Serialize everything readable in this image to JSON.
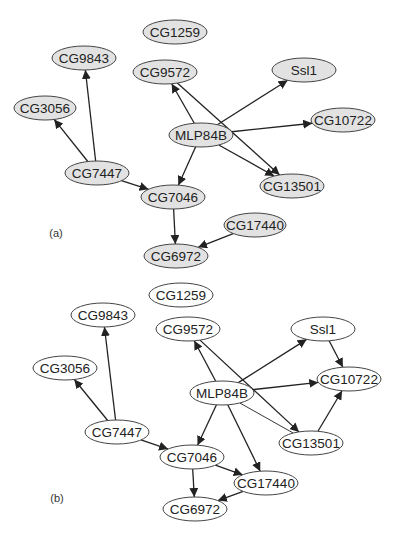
{
  "colors": {
    "node_fill_a": "#e2e2e2",
    "node_fill_b": "#ffffff",
    "stroke": "#444444",
    "edge": "#222222"
  },
  "panels": [
    {
      "label": "(a)",
      "label_pos": [
        56,
        233
      ],
      "node_style": "node-a",
      "nodes": [
        {
          "id": "CG1259",
          "label": "CG1259",
          "x": 175,
          "y": 32,
          "rx": 32,
          "ry": 12
        },
        {
          "id": "CG9843",
          "label": "CG9843",
          "x": 84,
          "y": 58,
          "rx": 32,
          "ry": 12
        },
        {
          "id": "CG9572",
          "label": "CG9572",
          "x": 165,
          "y": 72,
          "rx": 32,
          "ry": 12
        },
        {
          "id": "Ssl1",
          "label": "Ssl1",
          "x": 304,
          "y": 70,
          "rx": 32,
          "ry": 12
        },
        {
          "id": "CG3056",
          "label": "CG3056",
          "x": 45,
          "y": 108,
          "rx": 31,
          "ry": 12
        },
        {
          "id": "MLP84B",
          "label": "MLP84B",
          "x": 201,
          "y": 135,
          "rx": 32,
          "ry": 12
        },
        {
          "id": "CG10722",
          "label": "CG10722",
          "x": 343,
          "y": 120,
          "rx": 32,
          "ry": 12
        },
        {
          "id": "CG7447",
          "label": "CG7447",
          "x": 97,
          "y": 173,
          "rx": 32,
          "ry": 12
        },
        {
          "id": "CG13501",
          "label": "CG13501",
          "x": 292,
          "y": 186,
          "rx": 32,
          "ry": 12
        },
        {
          "id": "CG7046",
          "label": "CG7046",
          "x": 173,
          "y": 197,
          "rx": 32,
          "ry": 12
        },
        {
          "id": "CG17440",
          "label": "CG17440",
          "x": 255,
          "y": 225,
          "rx": 31,
          "ry": 12
        },
        {
          "id": "CG6972",
          "label": "CG6972",
          "x": 176,
          "y": 256,
          "rx": 32,
          "ry": 12
        }
      ],
      "edges": [
        {
          "from": "CG7447",
          "to": "CG3056"
        },
        {
          "from": "CG7447",
          "to": "CG9843"
        },
        {
          "from": "CG7447",
          "to": "CG7046"
        },
        {
          "from": "MLP84B",
          "to": "CG9572"
        },
        {
          "from": "MLP84B",
          "to": "Ssl1"
        },
        {
          "from": "MLP84B",
          "to": "CG10722"
        },
        {
          "from": "MLP84B",
          "to": "CG13501"
        },
        {
          "from": "MLP84B",
          "to": "CG7046"
        },
        {
          "from": "CG9572",
          "to": "CG13501"
        },
        {
          "from": "CG7046",
          "to": "CG6972"
        },
        {
          "from": "CG17440",
          "to": "CG6972"
        }
      ]
    },
    {
      "label": "(b)",
      "label_pos": [
        57,
        498
      ],
      "node_style": "node-b",
      "nodes": [
        {
          "id": "CG1259",
          "label": "CG1259",
          "x": 181,
          "y": 295,
          "rx": 32,
          "ry": 12
        },
        {
          "id": "CG9843",
          "label": "CG9843",
          "x": 103,
          "y": 315,
          "rx": 32,
          "ry": 12
        },
        {
          "id": "CG9572",
          "label": "CG9572",
          "x": 188,
          "y": 329,
          "rx": 32,
          "ry": 12
        },
        {
          "id": "Ssl1",
          "label": "Ssl1",
          "x": 323,
          "y": 329,
          "rx": 32,
          "ry": 12
        },
        {
          "id": "CG3056",
          "label": "CG3056",
          "x": 65,
          "y": 368,
          "rx": 32,
          "ry": 12
        },
        {
          "id": "MLP84B",
          "label": "MLP84B",
          "x": 222,
          "y": 393,
          "rx": 32,
          "ry": 12
        },
        {
          "id": "CG10722",
          "label": "CG10722",
          "x": 349,
          "y": 379,
          "rx": 32,
          "ry": 12
        },
        {
          "id": "CG7447",
          "label": "CG7447",
          "x": 117,
          "y": 432,
          "rx": 32,
          "ry": 12
        },
        {
          "id": "CG13501",
          "label": "CG13501",
          "x": 311,
          "y": 443,
          "rx": 32,
          "ry": 12
        },
        {
          "id": "CG7046",
          "label": "CG7046",
          "x": 192,
          "y": 457,
          "rx": 32,
          "ry": 12
        },
        {
          "id": "CG17440",
          "label": "CG17440",
          "x": 266,
          "y": 483,
          "rx": 32,
          "ry": 12
        },
        {
          "id": "CG6972",
          "label": "CG6972",
          "x": 195,
          "y": 509,
          "rx": 32,
          "ry": 12
        }
      ],
      "edges": [
        {
          "from": "CG7447",
          "to": "CG3056"
        },
        {
          "from": "CG7447",
          "to": "CG9843"
        },
        {
          "from": "CG7447",
          "to": "CG7046"
        },
        {
          "from": "MLP84B",
          "to": "CG9572"
        },
        {
          "from": "MLP84B",
          "to": "Ssl1"
        },
        {
          "from": "MLP84B",
          "to": "CG10722"
        },
        {
          "from": "MLP84B",
          "to": "CG13501",
          "thin": true,
          "arrow": false
        },
        {
          "from": "MLP84B",
          "to": "CG7046"
        },
        {
          "from": "MLP84B",
          "to": "CG17440"
        },
        {
          "from": "CG9572",
          "to": "CG13501"
        },
        {
          "from": "Ssl1",
          "to": "CG10722"
        },
        {
          "from": "CG13501",
          "to": "CG10722"
        },
        {
          "from": "CG7046",
          "to": "CG6972"
        },
        {
          "from": "CG7046",
          "to": "CG17440"
        },
        {
          "from": "CG17440",
          "to": "CG6972"
        }
      ]
    }
  ]
}
